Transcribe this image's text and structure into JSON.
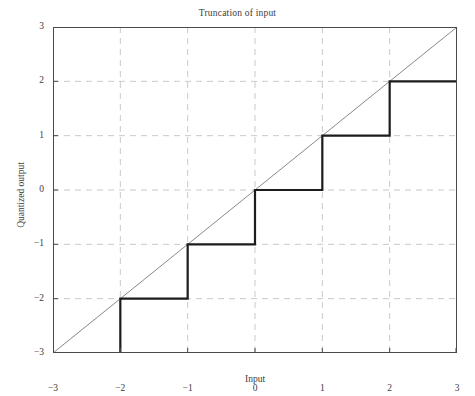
{
  "chart_data": {
    "type": "line",
    "title": "Truncation of input",
    "xlabel": "Input",
    "ylabel": "Quantized output",
    "xlim": [
      -3,
      3
    ],
    "ylim": [
      -3,
      3
    ],
    "grid": true,
    "legend": "none",
    "xticks": [
      "−3",
      "−2",
      "−1",
      "0",
      "1",
      "2",
      "3"
    ],
    "xtick_values": [
      -3,
      -2,
      -1,
      0,
      1,
      2,
      3
    ],
    "yticks": [
      "3",
      "2",
      "1",
      "0",
      "−1",
      "−2",
      "−3"
    ],
    "ytick_values": [
      3,
      2,
      1,
      0,
      -1,
      -2,
      -3
    ],
    "series": [
      {
        "name": "Truncation (staircase)",
        "style": "step-post",
        "color": "#1c1c1c",
        "width": 2.2,
        "x": [
          -3,
          -2,
          -2,
          -1,
          -1,
          0,
          0,
          1,
          1,
          2,
          2,
          3
        ],
        "values": [
          -3,
          -3,
          -2,
          -2,
          -1,
          -1,
          0,
          0,
          1,
          1,
          2,
          2
        ],
        "steps": [
          {
            "x_from": -3,
            "x_to": -2,
            "y": -3
          },
          {
            "x_from": -2,
            "x_to": -1,
            "y": -2
          },
          {
            "x_from": -1,
            "x_to": 0,
            "y": -1
          },
          {
            "x_from": 0,
            "x_to": 1,
            "y": 0
          },
          {
            "x_from": 1,
            "x_to": 2,
            "y": 1
          },
          {
            "x_from": 2,
            "x_to": 3,
            "y": 2
          }
        ]
      },
      {
        "name": "Identity reference y = x",
        "style": "solid-thin",
        "color": "#555555",
        "width": 0.7,
        "x": [
          -3,
          3
        ],
        "values": [
          -3,
          3
        ]
      }
    ],
    "gridline_color": "#c9c9c9",
    "axis_color": "#4a4a4a",
    "background": "#ffffff"
  },
  "figure": {
    "title": "Truncation of input",
    "xlabel": "Input",
    "ylabel": "Quantized output",
    "xticks": [
      "−3",
      "−2",
      "−1",
      "0",
      "1",
      "2",
      "3"
    ],
    "yticks": [
      "3",
      "2",
      "1",
      "0",
      "−1",
      "−2",
      "−3"
    ]
  }
}
